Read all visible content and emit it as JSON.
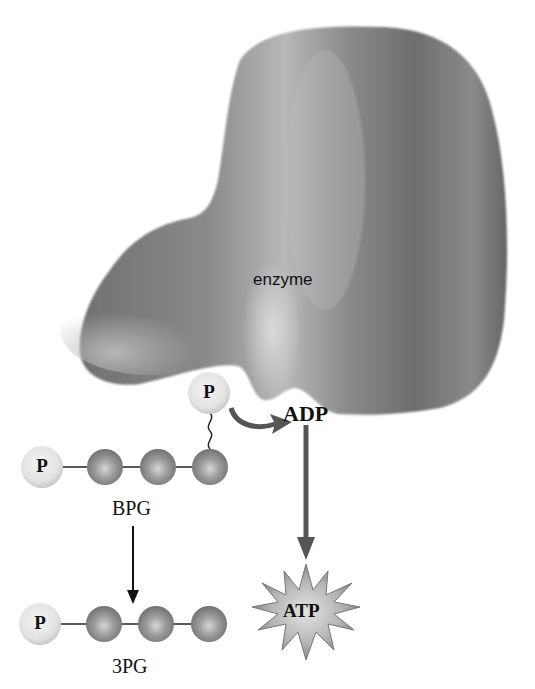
{
  "diagram": {
    "colors": {
      "enzyme": "#7a7a7a",
      "enzyme_highlight": "#c8c8c8",
      "phosphate": "#e6e6e6",
      "carbon_bead": "#8e8e8e",
      "arrow": "#555555",
      "text": "#111111"
    },
    "enzyme": {
      "label": "enzyme"
    },
    "bpg": {
      "label": "BPG",
      "phosphate_label": "P",
      "transfer_phosphate_label": "P",
      "carbons": 3
    },
    "pg3": {
      "label": "3PG",
      "phosphate_label": "P",
      "carbons": 3
    },
    "adp": {
      "label": "ADP"
    },
    "atp": {
      "label": "ATP"
    },
    "arrows": [
      {
        "from": "BPG phosphate",
        "to": "ADP",
        "style": "curved"
      },
      {
        "from": "ADP",
        "to": "ATP",
        "style": "straight"
      },
      {
        "from": "BPG",
        "to": "3PG",
        "style": "straight"
      }
    ]
  }
}
